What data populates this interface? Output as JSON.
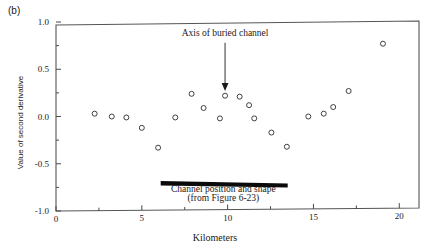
{
  "panel": {
    "label": "(b)"
  },
  "chart_data": {
    "type": "scatter",
    "title": "",
    "xlabel": "Kilometers",
    "ylabel": "Value of second derivative",
    "xlim": [
      0,
      20.8
    ],
    "ylim": [
      -1.0,
      1.0
    ],
    "grid": false,
    "legend": "none",
    "x_ticks": [
      0,
      5,
      10,
      15,
      20
    ],
    "x_tick_labels": [
      "0",
      "5",
      "10",
      "15",
      "20"
    ],
    "x_minor_ticks": [
      2.5,
      7.5,
      12.5,
      17.5
    ],
    "y_ticks": [
      -1.0,
      -0.5,
      0.0,
      0.5,
      1.0
    ],
    "y_tick_labels": [
      "-1.0",
      "-0.5",
      "0.0",
      "0.5",
      "1.0"
    ],
    "y_minor_ticks": [
      -0.75,
      -0.25,
      0.25,
      0.75
    ],
    "marker": "open-circle",
    "series": [
      {
        "name": "Second derivative",
        "points": [
          {
            "x": 2.25,
            "y": 0.03
          },
          {
            "x": 3.25,
            "y": 0.0
          },
          {
            "x": 4.1,
            "y": -0.01
          },
          {
            "x": 5.0,
            "y": -0.12
          },
          {
            "x": 5.95,
            "y": -0.33
          },
          {
            "x": 6.95,
            "y": -0.01
          },
          {
            "x": 7.9,
            "y": 0.24
          },
          {
            "x": 8.6,
            "y": 0.09
          },
          {
            "x": 9.55,
            "y": -0.02
          },
          {
            "x": 9.85,
            "y": 0.22
          },
          {
            "x": 10.7,
            "y": 0.21
          },
          {
            "x": 11.25,
            "y": 0.12
          },
          {
            "x": 11.55,
            "y": -0.02
          },
          {
            "x": 12.55,
            "y": -0.17
          },
          {
            "x": 13.45,
            "y": -0.32
          },
          {
            "x": 14.7,
            "y": 0.0
          },
          {
            "x": 15.6,
            "y": 0.03
          },
          {
            "x": 16.15,
            "y": 0.1
          },
          {
            "x": 17.05,
            "y": 0.27
          },
          {
            "x": 19.05,
            "y": 0.77
          }
        ]
      }
    ],
    "annotations": [
      {
        "name": "axis-of-buried-channel",
        "text": "Axis of buried channel",
        "text_x": 9.85,
        "text_y": 0.855,
        "arrow_from_y": 0.78,
        "arrow_to_y": 0.28,
        "arrow_x": 9.85
      },
      {
        "name": "channel-position-bar",
        "text_line1": "Channel position and shape",
        "text_line2": "(from Figure 6-23)",
        "text_x": 9.75,
        "text_line1_y": -0.8,
        "text_line2_y": -0.895,
        "bar_x_start": 6.1,
        "bar_x_end": 13.5,
        "bar_y": -0.705
      }
    ]
  },
  "colors": {
    "axis": "#4a4a4a",
    "marker_stroke": "#2b2b2b",
    "marker_fill": "#ffffff",
    "annotation": "#1a1a1a",
    "channel_bar": "#0a0a0a",
    "background": "#ffffff"
  }
}
